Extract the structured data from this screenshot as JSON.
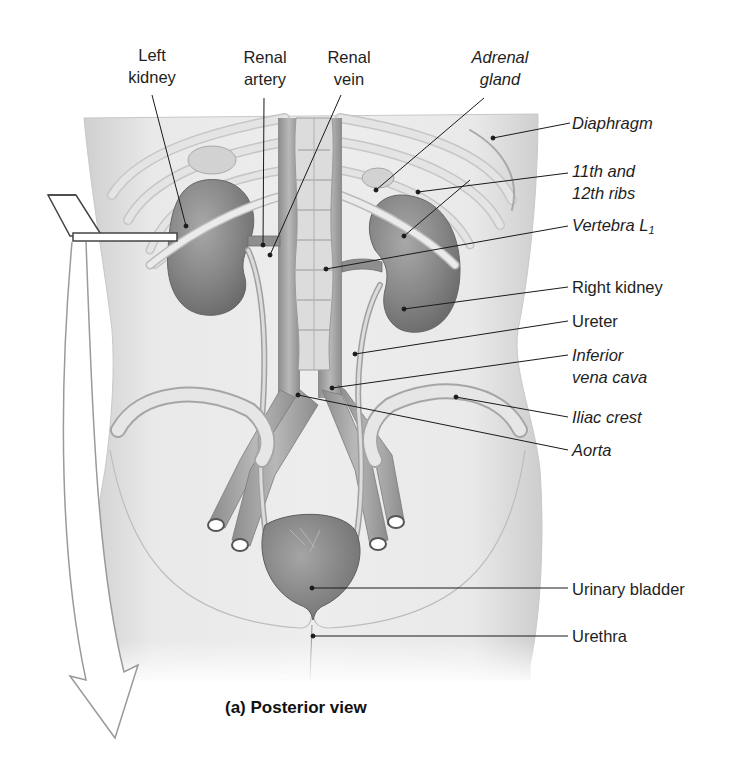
{
  "figure": {
    "caption": "(a) Posterior view",
    "view": "posterior",
    "colors": {
      "background": "#ffffff",
      "body": "#e6e6e6",
      "organ": "#8a8a8a",
      "bone": "#d8d8d8",
      "vessel": "#a9a9a9",
      "leader_line": "#1a1a1a",
      "text": "#1e1e1e"
    }
  },
  "labels": {
    "left_kidney": {
      "line1": "Left",
      "line2": "kidney",
      "style": "regular"
    },
    "renal_artery": {
      "line1": "Renal",
      "line2": "artery",
      "style": "regular"
    },
    "renal_vein": {
      "line1": "Renal",
      "line2": "vein",
      "style": "regular"
    },
    "adrenal_gland": {
      "line1": "Adrenal",
      "line2": "gland",
      "style": "italic"
    },
    "diaphragm": {
      "text": "Diaphragm",
      "style": "italic"
    },
    "ribs": {
      "line1": "11th and",
      "line2": "12th ribs",
      "style": "italic"
    },
    "vertebra": {
      "text": "Vertebra L",
      "subscript": "1",
      "style": "italic"
    },
    "right_kidney": {
      "text": "Right kidney",
      "style": "regular"
    },
    "ureter": {
      "text": "Ureter",
      "style": "regular"
    },
    "ivc": {
      "line1": "Inferior",
      "line2": "vena cava",
      "style": "italic"
    },
    "iliac_crest": {
      "text": "Iliac crest",
      "style": "italic"
    },
    "aorta": {
      "text": "Aorta",
      "style": "italic"
    },
    "urinary_bladder": {
      "text": "Urinary bladder",
      "style": "regular"
    },
    "urethra": {
      "text": "Urethra",
      "style": "regular"
    }
  }
}
